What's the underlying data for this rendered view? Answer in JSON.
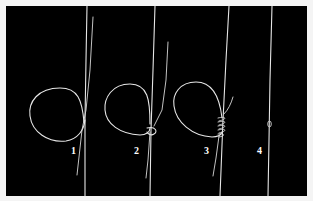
{
  "figure": {
    "type": "knot-tying steps",
    "background_color": "#000000",
    "frame_color": "#f4f4f4",
    "line_color": "#e6e6e6",
    "steps": [
      {
        "label": "1"
      },
      {
        "label": "2"
      },
      {
        "label": "3"
      },
      {
        "label": "4"
      }
    ]
  }
}
